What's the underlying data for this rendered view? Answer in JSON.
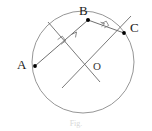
{
  "figure": {
    "caption": "Fig.",
    "background_color": "#ffffff",
    "stroke_color": "#6b6b6b",
    "chord_color": "#5a5a5a",
    "point_color": "#000000",
    "label_color": "#1a1a1a",
    "circle": {
      "name": "circle",
      "center_x": 83,
      "center_y": 62,
      "radius": 51
    },
    "points": [
      {
        "id": "A",
        "label": "A",
        "x": 35,
        "y": 66,
        "on_circle": true
      },
      {
        "id": "B",
        "label": "B",
        "x": 88,
        "y": 20,
        "on_circle": true
      },
      {
        "id": "C",
        "label": "C",
        "x": 124,
        "y": 33,
        "on_circle": true
      },
      {
        "id": "O",
        "label": "O",
        "x": 83,
        "y": 62,
        "on_circle": false
      }
    ],
    "chords": [
      {
        "id": "AB",
        "from": "A",
        "to": "B",
        "x1": 35,
        "y1": 66,
        "x2": 88,
        "y2": 20
      },
      {
        "id": "BC",
        "from": "B",
        "to": "C",
        "x1": 88,
        "y1": 20,
        "x2": 124,
        "y2": 33
      }
    ],
    "bisectors": [
      {
        "id": "bisector-AB",
        "of_chord": "AB",
        "x1": 48,
        "y1": 22,
        "x2": 99,
        "y2": 81,
        "midpoint_x": 61.5,
        "midpoint_y": 43
      },
      {
        "id": "bisector-BC",
        "of_chord": "BC",
        "x1": 130,
        "y1": 17,
        "x2": 63,
        "y2": 87,
        "midpoint_x": 106,
        "midpoint_y": 26.5
      }
    ],
    "right_angle_marks": [
      {
        "id": "mark-AB",
        "at_x": 61.5,
        "at_y": 43
      },
      {
        "id": "mark-BC",
        "at_x": 106,
        "at_y": 26.5
      }
    ],
    "tick_marks": [
      {
        "id": "tick-AB-1",
        "on": "AB"
      },
      {
        "id": "tick-BC-1",
        "on": "BC"
      }
    ]
  }
}
